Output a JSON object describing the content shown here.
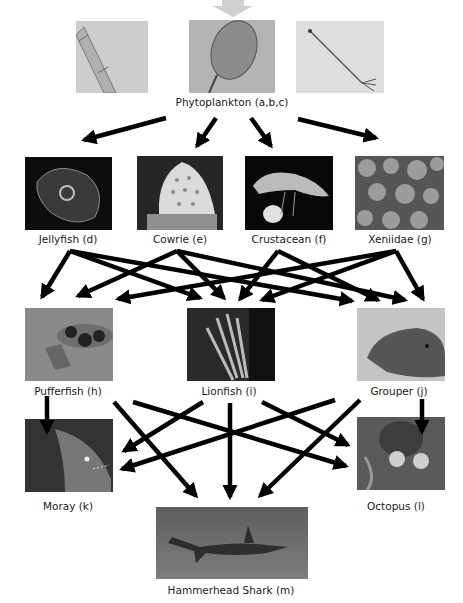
{
  "top_arrow_color": "#cfcfcf",
  "arrow_color": "#000000",
  "nodes": {
    "phyto": {
      "label": "Phytoplankton (a,b,c)"
    },
    "jellyfish": {
      "label": "Jellyfish (d)"
    },
    "cowrie": {
      "label": "Cowrie (e)"
    },
    "crustacean": {
      "label": "Crustacean (f)"
    },
    "xeniidae": {
      "label": "Xeniidae (g)"
    },
    "pufferfish": {
      "label": "Pufferfish (h)"
    },
    "lionfish": {
      "label": "Lionfish (i)"
    },
    "grouper": {
      "label": "Grouper (j)"
    },
    "moray": {
      "label": "Moray (k)"
    },
    "octopus": {
      "label": "Octopus (l)"
    },
    "shark": {
      "label": "Hammerhead Shark (m)"
    }
  },
  "edges": [
    [
      "phyto",
      "jellyfish"
    ],
    [
      "phyto",
      "cowrie"
    ],
    [
      "phyto",
      "crustacean"
    ],
    [
      "phyto",
      "xeniidae"
    ],
    [
      "jellyfish",
      "pufferfish"
    ],
    [
      "jellyfish",
      "lionfish"
    ],
    [
      "jellyfish",
      "grouper"
    ],
    [
      "cowrie",
      "pufferfish"
    ],
    [
      "cowrie",
      "lionfish"
    ],
    [
      "cowrie",
      "grouper"
    ],
    [
      "crustacean",
      "lionfish"
    ],
    [
      "crustacean",
      "grouper"
    ],
    [
      "xeniidae",
      "pufferfish"
    ],
    [
      "xeniidae",
      "lionfish"
    ],
    [
      "xeniidae",
      "grouper"
    ],
    [
      "pufferfish",
      "moray"
    ],
    [
      "pufferfish",
      "shark"
    ],
    [
      "pufferfish",
      "octopus"
    ],
    [
      "lionfish",
      "moray"
    ],
    [
      "lionfish",
      "shark"
    ],
    [
      "lionfish",
      "octopus"
    ],
    [
      "grouper",
      "moray"
    ],
    [
      "grouper",
      "shark"
    ],
    [
      "grouper",
      "octopus"
    ]
  ]
}
